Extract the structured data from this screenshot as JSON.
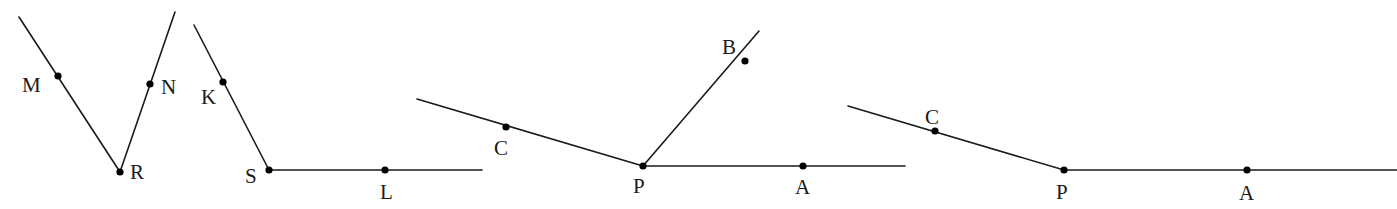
{
  "figures": [
    {
      "id": "fig1",
      "description": "Angle MRN",
      "vertex": {
        "name": "R",
        "x": 120,
        "y": 172,
        "label_x": 130,
        "label_y": 179
      },
      "rays": [
        {
          "from": [
            120,
            172
          ],
          "to": [
            19,
            17
          ],
          "point": {
            "name": "M",
            "x": 58,
            "y": 76,
            "label_x": 22,
            "label_y": 92
          }
        },
        {
          "from": [
            120,
            172
          ],
          "to": [
            175,
            12
          ],
          "point": {
            "name": "N",
            "x": 150,
            "y": 84,
            "label_x": 161,
            "label_y": 94
          }
        }
      ]
    },
    {
      "id": "fig2",
      "description": "Angle KSL",
      "vertex": {
        "name": "S",
        "x": 269,
        "y": 170,
        "label_x": 245,
        "label_y": 183
      },
      "rays": [
        {
          "from": [
            269,
            170
          ],
          "to": [
            194,
            25
          ],
          "point": {
            "name": "K",
            "x": 223,
            "y": 82,
            "label_x": 201,
            "label_y": 104
          }
        },
        {
          "from": [
            269,
            170
          ],
          "to": [
            482,
            170
          ],
          "point": {
            "name": "L",
            "x": 385,
            "y": 170,
            "label_x": 380,
            "label_y": 199
          }
        }
      ]
    },
    {
      "id": "fig3",
      "description": "Angles at P with rays PC, PB, PA",
      "vertex": {
        "name": "P",
        "x": 643,
        "y": 166,
        "label_x": 633,
        "label_y": 193
      },
      "rays": [
        {
          "from": [
            643,
            166
          ],
          "to": [
            417,
            99
          ],
          "point": {
            "name": "C",
            "x": 506,
            "y": 127,
            "label_x": 494,
            "label_y": 155
          }
        },
        {
          "from": [
            643,
            166
          ],
          "to": [
            759,
            31
          ],
          "point": {
            "name": "B",
            "x": 745,
            "y": 61,
            "label_x": 722,
            "label_y": 54
          }
        },
        {
          "from": [
            643,
            166
          ],
          "to": [
            905,
            166
          ],
          "point": {
            "name": "A",
            "x": 803,
            "y": 166,
            "label_x": 795,
            "label_y": 194
          }
        }
      ]
    },
    {
      "id": "fig4",
      "description": "Angle CPA",
      "vertex": {
        "name": "P",
        "x": 1064,
        "y": 170,
        "label_x": 1056,
        "label_y": 199
      },
      "rays": [
        {
          "from": [
            1064,
            170
          ],
          "to": [
            848,
            106
          ],
          "point": {
            "name": "C",
            "x": 935,
            "y": 131,
            "label_x": 925,
            "label_y": 124
          }
        },
        {
          "from": [
            1064,
            170
          ],
          "to": [
            1397,
            170
          ],
          "point": {
            "name": "A",
            "x": 1247,
            "y": 170,
            "label_x": 1239,
            "label_y": 200
          }
        }
      ]
    }
  ],
  "labels": {
    "fig1": {
      "M": "M",
      "N": "N",
      "R": "R"
    },
    "fig2": {
      "K": "K",
      "S": "S",
      "L": "L"
    },
    "fig3": {
      "C": "C",
      "B": "B",
      "P": "P",
      "A": "A"
    },
    "fig4": {
      "C": "C",
      "P": "P",
      "A": "A"
    }
  },
  "colors": {
    "line": "#1a1a1a",
    "point": "#000000",
    "background": "#ffffff"
  }
}
